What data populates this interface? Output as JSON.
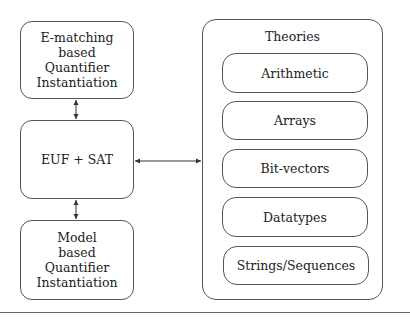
{
  "left_column": {
    "ematching": {
      "line1": "E-matching",
      "line2": "based",
      "line3": "Quantifier",
      "line4": "Instantiation"
    },
    "core": {
      "label": "EUF + SAT"
    },
    "model": {
      "line1": "Model",
      "line2": "based",
      "line3": "Quantifier",
      "line4": "Instantiation"
    }
  },
  "theories": {
    "title": "Theories",
    "items": [
      {
        "label": "Arithmetic"
      },
      {
        "label": "Arrays"
      },
      {
        "label": "Bit-vectors"
      },
      {
        "label": "Datatypes"
      },
      {
        "label": "Strings/Sequences"
      }
    ]
  },
  "edges": [
    {
      "from": "E-matching based Quantifier Instantiation",
      "to": "EUF + SAT",
      "type": "bidirectional"
    },
    {
      "from": "EUF + SAT",
      "to": "Model based Quantifier Instantiation",
      "type": "bidirectional"
    },
    {
      "from": "EUF + SAT",
      "to": "Theories",
      "type": "bidirectional"
    }
  ]
}
